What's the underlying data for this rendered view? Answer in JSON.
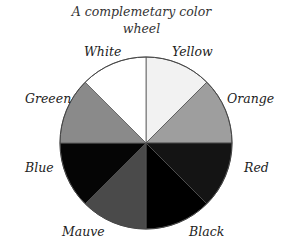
{
  "title_line1": "A complemetary color",
  "title_line2": "wheel",
  "wheel": {
    "cx": 146,
    "cy": 143,
    "r": 86,
    "slices": [
      {
        "name": "Yellow",
        "fill": "#f2f2f2",
        "start": -90,
        "end": -45
      },
      {
        "name": "Orange",
        "fill": "#9e9e9e",
        "start": -45,
        "end": 0
      },
      {
        "name": "Red",
        "fill": "#141414",
        "start": 0,
        "end": 45
      },
      {
        "name": "Black",
        "fill": "#000000",
        "start": 45,
        "end": 90
      },
      {
        "name": "Mauve",
        "fill": "#4a4a4a",
        "start": 90,
        "end": 135
      },
      {
        "name": "Blue",
        "fill": "#050505",
        "start": 135,
        "end": 180
      },
      {
        "name": "Green",
        "fill": "#8a8a8a",
        "start": 180,
        "end": 225
      },
      {
        "name": "White",
        "fill": "#ffffff",
        "start": 225,
        "end": 270
      }
    ]
  },
  "labels": {
    "white": "White",
    "yellow": "Yellow",
    "orange": "Orange",
    "red": "Red",
    "black": "Black",
    "mauve": "Mauve",
    "blue": "Blue",
    "green": "Greeen"
  }
}
